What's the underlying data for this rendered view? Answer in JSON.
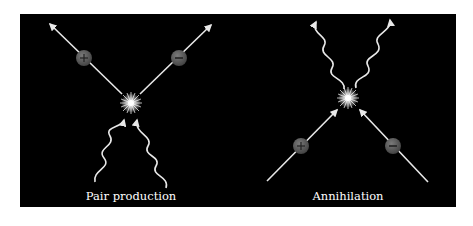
{
  "diagram": {
    "background": "#000000",
    "line_color": "#e8e8e8",
    "particle_color": "#5a5a5a",
    "panels": [
      {
        "id": "pair-production",
        "label": "Pair production",
        "incoming": [
          "photon",
          "photon"
        ],
        "outgoing": [
          {
            "particle": "positron",
            "symbol": "+"
          },
          {
            "particle": "electron",
            "symbol": "−"
          }
        ]
      },
      {
        "id": "annihilation",
        "label": "Annihilation",
        "incoming": [
          {
            "particle": "positron",
            "symbol": "+"
          },
          {
            "particle": "electron",
            "symbol": "−"
          }
        ],
        "outgoing": [
          "photon",
          "photon"
        ]
      }
    ]
  }
}
